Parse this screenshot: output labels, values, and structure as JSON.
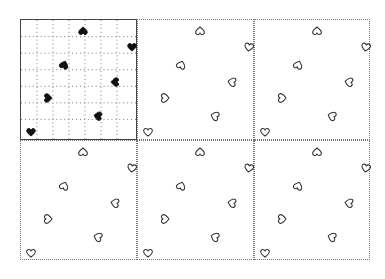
{
  "diagram": {
    "grid_size": 7,
    "colors": {
      "filled_heart": "#111111",
      "outline_heart": "#333333",
      "border": "#444444",
      "dotted": "#777777"
    },
    "panels": [
      {
        "id": "p1",
        "x": 20,
        "y": 19,
        "w": 117,
        "h": 121,
        "style": "grid",
        "hearts": [
          {
            "x": 57,
            "y": 6,
            "rot": 180,
            "filled": true
          },
          {
            "x": 106,
            "y": 22,
            "rot": 0,
            "filled": true
          },
          {
            "x": 38,
            "y": 40,
            "rot": 200,
            "filled": true
          },
          {
            "x": 89,
            "y": 57,
            "rot": 90,
            "filled": true
          },
          {
            "x": 22,
            "y": 73,
            "rot": 270,
            "filled": true
          },
          {
            "x": 72,
            "y": 91,
            "rot": 100,
            "filled": true
          },
          {
            "x": 5,
            "y": 107,
            "rot": 0,
            "filled": true
          }
        ]
      },
      {
        "id": "p2",
        "x": 137,
        "y": 19,
        "w": 117,
        "h": 121,
        "style": "dotted",
        "hearts": [
          {
            "x": 57,
            "y": 6,
            "rot": 180
          },
          {
            "x": 106,
            "y": 22,
            "rot": 10
          },
          {
            "x": 38,
            "y": 40,
            "rot": 200
          },
          {
            "x": 89,
            "y": 57,
            "rot": 100
          },
          {
            "x": 22,
            "y": 73,
            "rot": 270
          },
          {
            "x": 72,
            "y": 91,
            "rot": 110
          },
          {
            "x": 5,
            "y": 107,
            "rot": 0
          }
        ]
      },
      {
        "id": "p3",
        "x": 254,
        "y": 19,
        "w": 116,
        "h": 121,
        "style": "dotted",
        "hearts": [
          {
            "x": 57,
            "y": 6,
            "rot": 180
          },
          {
            "x": 106,
            "y": 22,
            "rot": 10
          },
          {
            "x": 38,
            "y": 40,
            "rot": 200
          },
          {
            "x": 89,
            "y": 57,
            "rot": 100
          },
          {
            "x": 22,
            "y": 73,
            "rot": 270
          },
          {
            "x": 72,
            "y": 91,
            "rot": 110
          },
          {
            "x": 5,
            "y": 107,
            "rot": 0
          }
        ]
      },
      {
        "id": "p4",
        "x": 20,
        "y": 140,
        "w": 117,
        "h": 120,
        "style": "dotted",
        "hearts": [
          {
            "x": 57,
            "y": 6,
            "rot": 180
          },
          {
            "x": 106,
            "y": 22,
            "rot": 10
          },
          {
            "x": 38,
            "y": 40,
            "rot": 200
          },
          {
            "x": 89,
            "y": 57,
            "rot": 100
          },
          {
            "x": 22,
            "y": 73,
            "rot": 270
          },
          {
            "x": 72,
            "y": 91,
            "rot": 110
          },
          {
            "x": 5,
            "y": 107,
            "rot": 0
          }
        ]
      },
      {
        "id": "p5",
        "x": 137,
        "y": 140,
        "w": 117,
        "h": 120,
        "style": "dotted",
        "hearts": [
          {
            "x": 57,
            "y": 6,
            "rot": 180
          },
          {
            "x": 106,
            "y": 22,
            "rot": 10
          },
          {
            "x": 38,
            "y": 40,
            "rot": 200
          },
          {
            "x": 89,
            "y": 57,
            "rot": 100
          },
          {
            "x": 22,
            "y": 73,
            "rot": 270
          },
          {
            "x": 72,
            "y": 91,
            "rot": 110
          },
          {
            "x": 5,
            "y": 107,
            "rot": 0
          }
        ]
      },
      {
        "id": "p6",
        "x": 254,
        "y": 140,
        "w": 116,
        "h": 120,
        "style": "dotted",
        "hearts": [
          {
            "x": 57,
            "y": 6,
            "rot": 180
          },
          {
            "x": 106,
            "y": 22,
            "rot": 10
          },
          {
            "x": 38,
            "y": 40,
            "rot": 200
          },
          {
            "x": 89,
            "y": 57,
            "rot": 100
          },
          {
            "x": 22,
            "y": 73,
            "rot": 270
          },
          {
            "x": 72,
            "y": 91,
            "rot": 110
          },
          {
            "x": 5,
            "y": 107,
            "rot": 0
          }
        ]
      }
    ]
  }
}
